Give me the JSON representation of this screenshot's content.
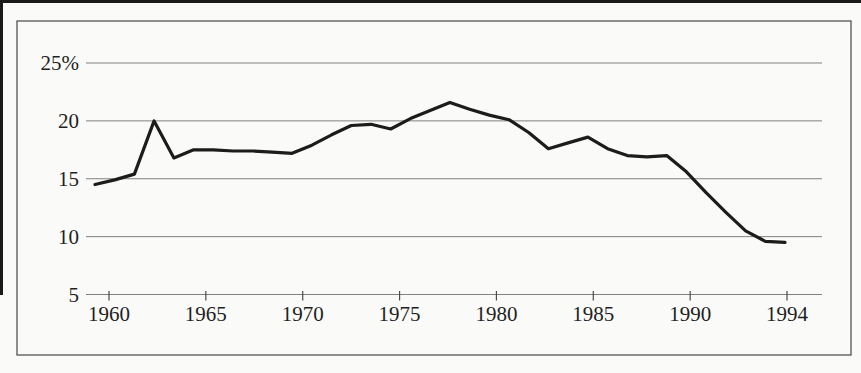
{
  "page": {
    "background": "#fafaf8",
    "crop_rule_color": "#1a1a1a"
  },
  "chart_data": {
    "type": "line",
    "title": "",
    "x_label": "",
    "y_label": "",
    "legend": "none",
    "grid": "horizontal-only",
    "ylim": [
      5,
      26
    ],
    "x": [
      1959,
      1960,
      1961,
      1962,
      1963,
      1964,
      1965,
      1966,
      1967,
      1968,
      1969,
      1970,
      1971,
      1972,
      1973,
      1974,
      1975,
      1976,
      1977,
      1978,
      1979,
      1980,
      1981,
      1982,
      1983,
      1984,
      1985,
      1986,
      1987,
      1988,
      1989,
      1990,
      1991,
      1992,
      1993,
      1994
    ],
    "series": [
      {
        "name": "percent-share",
        "values": [
          14.5,
          14.9,
          15.4,
          20.0,
          16.8,
          17.5,
          17.5,
          17.4,
          17.4,
          17.3,
          17.2,
          17.9,
          18.8,
          19.6,
          19.7,
          19.3,
          20.2,
          20.9,
          21.6,
          21.0,
          20.5,
          20.1,
          19.0,
          17.6,
          18.1,
          18.6,
          17.6,
          17.0,
          16.9,
          17.0,
          15.6,
          13.8,
          12.1,
          10.5,
          9.6,
          9.5
        ]
      }
    ],
    "y_ticks": [
      {
        "value": 25,
        "label": "25%"
      },
      {
        "value": 20,
        "label": "20"
      },
      {
        "value": 15,
        "label": "15"
      },
      {
        "value": 10,
        "label": "10"
      },
      {
        "value": 5,
        "label": "5"
      }
    ],
    "x_ticks": [
      "1960",
      "1965",
      "1970",
      "1975",
      "1980",
      "1985",
      "1990",
      "1994"
    ],
    "colors": {
      "line": "#1c1c1c",
      "grid": "#818181",
      "tick": "#4a4a4a",
      "frame": "#555555",
      "text": "#1f1f1f"
    }
  }
}
